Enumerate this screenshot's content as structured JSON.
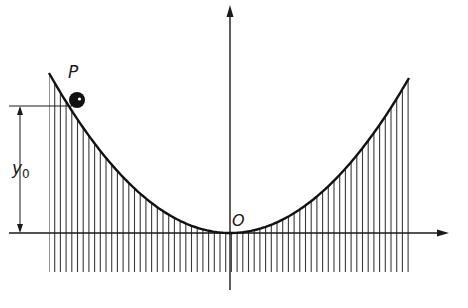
{
  "figure": {
    "labels": {
      "point": "P",
      "origin": "O",
      "height_symbol": "y",
      "height_subscript": "0"
    },
    "colors": {
      "ink": "#1a1a1a",
      "hatch": "#3a3a3a",
      "background": "#ffffff"
    },
    "geometry": {
      "width": 468,
      "height": 308,
      "origin": [
        230,
        233
      ],
      "y_axis": {
        "x": 230,
        "top": 5,
        "bottom": 290
      },
      "x_axis": {
        "y": 233,
        "left": 9,
        "right": 449
      },
      "curve_left_end": [
        49,
        73
      ],
      "curve_right_end": [
        409,
        78
      ],
      "ball": {
        "cx": 77,
        "cy": 100,
        "r": 8
      },
      "y0_marker_y": 106,
      "y0_arrow_x": 20,
      "hatch": {
        "x_start": 49,
        "x_end": 409,
        "spacing": 5.7,
        "bottom": 272
      }
    }
  }
}
